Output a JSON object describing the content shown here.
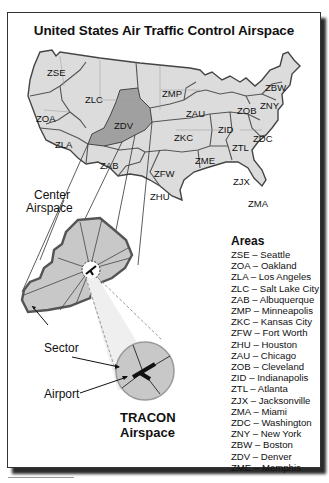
{
  "title": "United States Air Traffic Control Airspace",
  "colors": {
    "land": "#dcdcdc",
    "highlight_center": "#a0a0a0",
    "border": "#555555",
    "tracon_fill": "#c8c8c8"
  },
  "map_labels": {
    "zse": "ZSE",
    "zoa": "ZOA",
    "zla": "ZLA",
    "zlc": "ZLC",
    "zab": "ZAB",
    "zdv": "ZDV",
    "zmp": "ZMP",
    "zkc": "ZKC",
    "zfw": "ZFW",
    "zhu": "ZHU",
    "zau": "ZAU",
    "zob": "ZOB",
    "zid": "ZID",
    "ztl": "ZTL",
    "zjx": "ZJX",
    "zma": "ZMA",
    "zdc": "ZDC",
    "zny": "ZNY",
    "zbw": "ZBW",
    "zme": "ZME"
  },
  "callouts": {
    "center_airspace_line1": "Center",
    "center_airspace_line2": "Airspace",
    "sector": "Sector",
    "airport": "Airport",
    "tracon_line1": "TRACON",
    "tracon_line2": "Airspace"
  },
  "legend": {
    "heading": "Areas",
    "items": [
      {
        "code": "ZSE",
        "name": "Seattle"
      },
      {
        "code": "ZOA",
        "name": "Oakland"
      },
      {
        "code": "ZLA",
        "name": "Los Angeles"
      },
      {
        "code": "ZLC",
        "name": "Salt Lake City"
      },
      {
        "code": "ZAB",
        "name": "Albuquerque"
      },
      {
        "code": "ZMP",
        "name": "Minneapolis"
      },
      {
        "code": "ZKC",
        "name": "Kansas City"
      },
      {
        "code": "ZFW",
        "name": "Fort Worth"
      },
      {
        "code": "ZHU",
        "name": "Houston"
      },
      {
        "code": "ZAU",
        "name": "Chicago"
      },
      {
        "code": "ZOB",
        "name": "Cleveland"
      },
      {
        "code": "ZID",
        "name": "Indianapolis"
      },
      {
        "code": "ZTL",
        "name": "Atlanta"
      },
      {
        "code": "ZJX",
        "name": "Jacksonville"
      },
      {
        "code": "ZMA",
        "name": "Miami"
      },
      {
        "code": "ZDC",
        "name": "Washington"
      },
      {
        "code": "ZNY",
        "name": "New York"
      },
      {
        "code": "ZBW",
        "name": "Boston"
      },
      {
        "code": "ZDV",
        "name": "Denver"
      },
      {
        "code": "ZME",
        "name": "Memphis"
      }
    ]
  }
}
